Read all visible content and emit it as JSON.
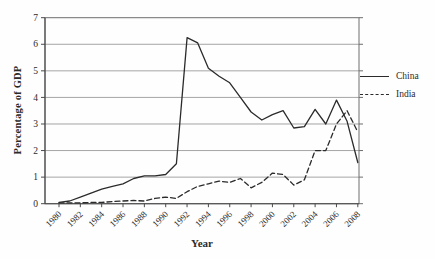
{
  "chart_data": {
    "type": "line",
    "title": "",
    "xlabel": "Year",
    "ylabel": "Percentage of GDP",
    "x": [
      1980,
      1981,
      1982,
      1983,
      1984,
      1985,
      1986,
      1987,
      1988,
      1989,
      1990,
      1991,
      1992,
      1993,
      1994,
      1995,
      1996,
      1997,
      1998,
      1999,
      2000,
      2001,
      2002,
      2003,
      2004,
      2005,
      2006,
      2007,
      2008
    ],
    "x_tick_labels": [
      "1980",
      "1982",
      "1984",
      "1986",
      "1988",
      "1990",
      "1992",
      "1994",
      "1996",
      "1998",
      "2000",
      "2002",
      "2004",
      "2006",
      "2008"
    ],
    "ylim": [
      0,
      7
    ],
    "yticks": [
      0,
      1,
      2,
      3,
      4,
      5,
      6,
      7
    ],
    "grid": "horizontal",
    "legend_position": "right",
    "line_color": "#2b2b2b",
    "series": [
      {
        "name": "China",
        "style": "solid",
        "color": "#2b2b2b",
        "values": [
          0.05,
          0.1,
          0.25,
          0.4,
          0.55,
          0.65,
          0.75,
          0.95,
          1.05,
          1.05,
          1.1,
          1.5,
          6.25,
          6.05,
          5.1,
          4.8,
          4.55,
          4.0,
          3.45,
          3.15,
          3.35,
          3.5,
          2.85,
          2.9,
          3.55,
          3.0,
          3.9,
          3.1,
          1.55
        ]
      },
      {
        "name": "India",
        "style": "dashed",
        "color": "#2b2b2b",
        "values": [
          0.03,
          0.03,
          0.03,
          0.05,
          0.05,
          0.08,
          0.1,
          0.12,
          0.1,
          0.2,
          0.25,
          0.2,
          0.45,
          0.65,
          0.75,
          0.85,
          0.8,
          0.95,
          0.6,
          0.8,
          1.15,
          1.1,
          0.7,
          0.9,
          2.0,
          2.0,
          3.0,
          3.5,
          2.7
        ]
      }
    ]
  }
}
